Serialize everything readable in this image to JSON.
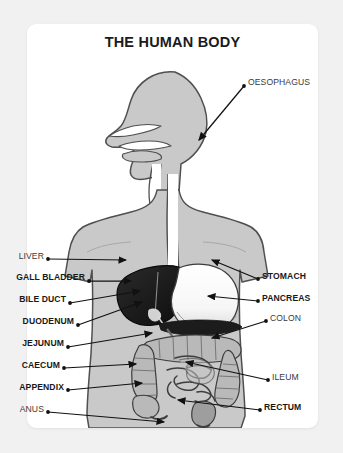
{
  "page": {
    "background_color": "#f1f1f1",
    "card_color": "#ffffff"
  },
  "header": {
    "title": "THE HUMAN BODY"
  },
  "diagram": {
    "colors": {
      "body_fill": "#c9c9c9",
      "body_outline": "#4a4a4a",
      "liver_fill": "#1c1c1c",
      "stomach_fill": "#ffffff",
      "intestine_fill": "#b5b5b5",
      "label_text": "#3a3a3a",
      "leader_line": "#111111"
    },
    "labels_left": [
      {
        "id": "liver",
        "text": "LIVER",
        "bold": false,
        "x": 14,
        "y": 256,
        "dot_x": 48,
        "dot_y": 259,
        "tip_x": 126,
        "tip_y": 260
      },
      {
        "id": "gall-bladder",
        "text": "GALL BLADDER",
        "bold": true,
        "x": 14,
        "y": 277,
        "dot_x": 89,
        "dot_y": 281,
        "tip_x": 131,
        "tip_y": 281
      },
      {
        "id": "bile-duct",
        "text": "BILE DUCT",
        "bold": true,
        "x": 14,
        "y": 299,
        "dot_x": 70,
        "dot_y": 303,
        "tip_x": 140,
        "tip_y": 291
      },
      {
        "id": "duodenum",
        "text": "DUODENUM",
        "bold": true,
        "x": 14,
        "y": 321,
        "dot_x": 78,
        "dot_y": 325,
        "tip_x": 142,
        "tip_y": 302
      },
      {
        "id": "jejunum",
        "text": "JEJUNUM",
        "bold": true,
        "x": 14,
        "y": 343,
        "dot_x": 68,
        "dot_y": 347,
        "tip_x": 152,
        "tip_y": 333
      },
      {
        "id": "caecum",
        "text": "CAECUM",
        "bold": true,
        "x": 14,
        "y": 365,
        "dot_x": 64,
        "dot_y": 368,
        "tip_x": 136,
        "tip_y": 364
      },
      {
        "id": "appendix",
        "text": "APPENDIX",
        "bold": true,
        "x": 14,
        "y": 387,
        "dot_x": 68,
        "dot_y": 390,
        "tip_x": 142,
        "tip_y": 383
      },
      {
        "id": "anus",
        "text": "ANUS",
        "bold": false,
        "x": 14,
        "y": 409,
        "dot_x": 48,
        "dot_y": 412,
        "tip_x": 164,
        "tip_y": 422
      }
    ],
    "labels_right": [
      {
        "id": "oesophagus",
        "text": "OESOPHAGUS",
        "bold": false,
        "x": 248,
        "y": 82,
        "dot_x": 244,
        "dot_y": 86,
        "tip_x": 199,
        "tip_y": 140
      },
      {
        "id": "stomach",
        "text": "STOMACH",
        "bold": true,
        "x": 262,
        "y": 276,
        "dot_x": 258,
        "dot_y": 279,
        "tip_x": 212,
        "tip_y": 260
      },
      {
        "id": "pancreas",
        "text": "PANCREAS",
        "bold": true,
        "x": 262,
        "y": 298,
        "dot_x": 258,
        "dot_y": 301,
        "tip_x": 208,
        "tip_y": 296
      },
      {
        "id": "colon",
        "text": "COLON",
        "bold": false,
        "x": 270,
        "y": 318,
        "dot_x": 266,
        "dot_y": 321,
        "tip_x": 212,
        "tip_y": 338
      },
      {
        "id": "ileum",
        "text": "ILEUM",
        "bold": false,
        "x": 272,
        "y": 377,
        "dot_x": 268,
        "dot_y": 380,
        "tip_x": 186,
        "tip_y": 362
      },
      {
        "id": "rectum",
        "text": "RECTUM",
        "bold": true,
        "x": 264,
        "y": 407,
        "dot_x": 260,
        "dot_y": 410,
        "tip_x": 178,
        "tip_y": 400
      }
    ]
  }
}
